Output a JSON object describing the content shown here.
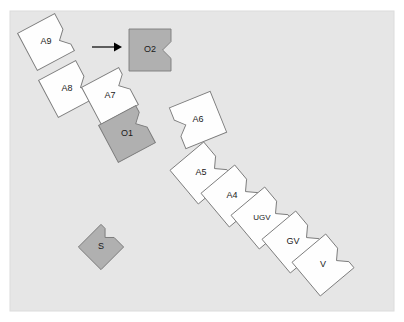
{
  "figure": {
    "type": "diagram",
    "subtype": "puzzle-piece-block-diagram",
    "panel": {
      "x": 10,
      "y": 11,
      "width": 384,
      "height": 300,
      "fill": "#e6e6e6",
      "border": "#dcdcdc"
    },
    "palette": {
      "piece_white_fill": "#fefefe",
      "piece_gray_fill": "#b0b0b0",
      "piece_stroke": "#7a7a7a",
      "label_color": "#1a1a1a",
      "arrow_color": "#000000",
      "page_background": "#ffffff"
    }
  },
  "arrow": {
    "label": "",
    "from_x": 92,
    "to_x": 122,
    "y": 47,
    "color": "#000000",
    "direction": "right"
  },
  "pieces": [
    {
      "id": "A9",
      "label": "A9",
      "fill": "white",
      "cx": 46,
      "cy": 42,
      "size": 42,
      "rotation": -28,
      "notch": "bottom-right",
      "group": "upper-left-chain"
    },
    {
      "id": "A8",
      "label": "A8",
      "fill": "white",
      "cx": 67,
      "cy": 89,
      "size": 42,
      "rotation": -28,
      "notch": "bottom-right",
      "group": "upper-left-chain"
    },
    {
      "id": "A7",
      "label": "A7",
      "fill": "white",
      "cx": 110,
      "cy": 96,
      "size": 42,
      "rotation": -28,
      "notch": "top-right",
      "group": "upper-left-chain"
    },
    {
      "id": "O2",
      "label": "O2",
      "fill": "gray",
      "cx": 150,
      "cy": 50,
      "size": 42,
      "rotation": 0,
      "notch": "right",
      "group": "objective"
    },
    {
      "id": "O1",
      "label": "O1",
      "fill": "gray",
      "cx": 127,
      "cy": 134,
      "size": 42,
      "rotation": -28,
      "notch": "top-right",
      "group": "objective"
    },
    {
      "id": "S",
      "label": "S",
      "fill": "gray",
      "cx": 101,
      "cy": 247,
      "size": 32,
      "rotation": -45,
      "notch": "top-right",
      "group": "source"
    },
    {
      "id": "A6",
      "label": "A6",
      "fill": "white",
      "cx": 198,
      "cy": 120,
      "size": 44,
      "rotation": -22,
      "notch": "left",
      "group": "main-chain"
    },
    {
      "id": "A5",
      "label": "A5",
      "fill": "white",
      "cx": 201,
      "cy": 173,
      "size": 44,
      "rotation": -40,
      "notch": "bottom-right",
      "group": "main-chain"
    },
    {
      "id": "A4",
      "label": "A4",
      "fill": "white",
      "cx": 232,
      "cy": 196,
      "size": 44,
      "rotation": -40,
      "notch": "bottom-right",
      "group": "main-chain"
    },
    {
      "id": "UGV",
      "label": "UGV",
      "fill": "white",
      "cx": 262,
      "cy": 218,
      "size": 44,
      "rotation": -40,
      "notch": "bottom-right",
      "group": "main-chain"
    },
    {
      "id": "GV",
      "label": "GV",
      "fill": "white",
      "cx": 293,
      "cy": 242,
      "size": 44,
      "rotation": -40,
      "notch": "bottom-right",
      "group": "main-chain"
    },
    {
      "id": "V",
      "label": "V",
      "fill": "white",
      "cx": 323,
      "cy": 265,
      "size": 44,
      "rotation": -40,
      "notch": "bottom-right",
      "group": "main-chain"
    }
  ]
}
